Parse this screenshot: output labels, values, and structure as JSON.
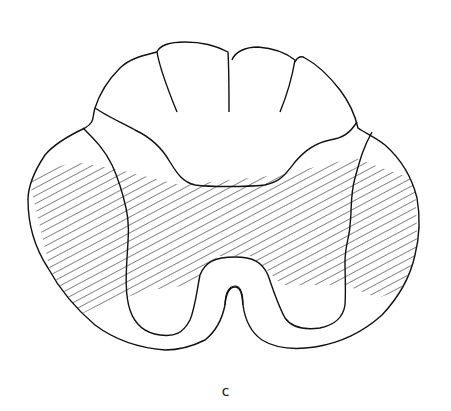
{
  "figure": {
    "label": "c",
    "colors": {
      "line": "#111111",
      "background": "#ffffff"
    }
  }
}
